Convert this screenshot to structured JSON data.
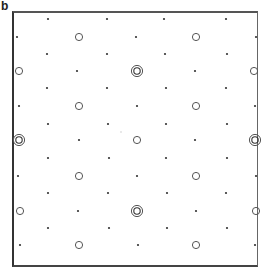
{
  "panel": {
    "label": "b"
  },
  "colors": {
    "dot": "#333333",
    "ring": "#555555",
    "frame": "#444444",
    "background": "#ffffff"
  },
  "lattice": {
    "description": "Periodic 2D lattice pattern: small dots and open circles; double (concentric) circles mark larger features",
    "dots": [
      [
        48,
        19
      ],
      [
        107,
        19
      ],
      [
        164,
        19
      ],
      [
        226,
        19
      ],
      [
        17,
        37
      ],
      [
        136,
        37
      ],
      [
        256,
        37
      ],
      [
        47,
        54
      ],
      [
        107,
        54
      ],
      [
        165,
        54
      ],
      [
        227,
        54
      ],
      [
        77,
        71
      ],
      [
        195,
        71
      ],
      [
        47,
        88
      ],
      [
        107,
        88
      ],
      [
        166,
        88
      ],
      [
        226,
        88
      ],
      [
        19,
        106
      ],
      [
        137,
        106
      ],
      [
        255,
        106
      ],
      [
        48,
        124
      ],
      [
        108,
        124
      ],
      [
        166,
        124
      ],
      [
        227,
        124
      ],
      [
        79,
        140
      ],
      [
        195,
        140
      ],
      [
        48,
        158
      ],
      [
        109,
        158
      ],
      [
        166,
        158
      ],
      [
        227,
        158
      ],
      [
        18,
        176
      ],
      [
        137,
        176
      ],
      [
        256,
        176
      ],
      [
        48,
        193
      ],
      [
        108,
        193
      ],
      [
        167,
        193
      ],
      [
        226,
        193
      ],
      [
        78,
        211
      ],
      [
        196,
        211
      ],
      [
        48,
        228
      ],
      [
        109,
        228
      ],
      [
        167,
        228
      ],
      [
        227,
        228
      ],
      [
        20,
        245
      ],
      [
        138,
        245
      ],
      [
        255,
        245
      ]
    ],
    "open_circles": [
      [
        79,
        37
      ],
      [
        196,
        37
      ],
      [
        19,
        71
      ],
      [
        254,
        71
      ],
      [
        79,
        106
      ],
      [
        196,
        106
      ],
      [
        137,
        140
      ],
      [
        79,
        176
      ],
      [
        196,
        176
      ],
      [
        20,
        211
      ],
      [
        256,
        211
      ],
      [
        79,
        245
      ],
      [
        196,
        245
      ]
    ],
    "double_circles": [
      [
        137,
        71
      ],
      [
        19,
        140
      ],
      [
        255,
        140
      ],
      [
        137,
        211
      ]
    ],
    "faint_marks": [
      [
        121,
        132
      ]
    ]
  }
}
